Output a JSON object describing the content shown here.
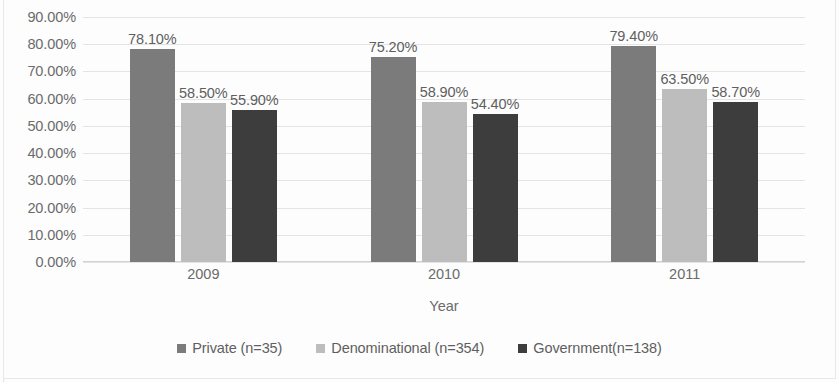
{
  "chart_data": {
    "type": "bar",
    "title": "",
    "xlabel": "Year",
    "ylabel": "",
    "categories": [
      "2009",
      "2010",
      "2011"
    ],
    "series": [
      {
        "name": "Private (n=35)",
        "color": "#7b7b7b",
        "values": [
          78.1,
          58.5,
          79.4
        ],
        "labels": [
          "78.10%",
          "58.50%",
          "79.40%"
        ]
      },
      {
        "name": "Denominational (n=354)",
        "color": "#bdbdbd",
        "values": [
          58.5,
          58.9,
          63.5
        ],
        "labels": [
          "58.50%",
          "58.90%",
          "63.50%"
        ]
      },
      {
        "name": "Government(n=138)",
        "color": "#3d3d3d",
        "values": [
          55.9,
          54.4,
          58.7
        ],
        "labels": [
          "55.90%",
          "54.40%",
          "58.70%"
        ]
      }
    ],
    "grouped_values": [
      [
        78.1,
        58.5,
        55.9
      ],
      [
        75.2,
        58.9,
        54.4
      ],
      [
        79.4,
        63.5,
        58.7
      ]
    ],
    "grouped_labels": [
      [
        "78.10%",
        "58.50%",
        "55.90%"
      ],
      [
        "75.20%",
        "58.90%",
        "54.40%"
      ],
      [
        "79.40%",
        "63.50%",
        "58.70%"
      ]
    ],
    "ylim": [
      0,
      90
    ],
    "ytick_step": 10,
    "ytick_labels": [
      "90.00%",
      "80.00%",
      "70.00%",
      "60.00%",
      "50.00%",
      "40.00%",
      "30.00%",
      "20.00%",
      "10.00%",
      "0.00%"
    ],
    "ytick_values": [
      90,
      80,
      70,
      60,
      50,
      40,
      30,
      20,
      10,
      0
    ],
    "grid": true,
    "legend_position": "bottom"
  },
  "axis": {
    "x_title": "Year"
  },
  "legend": {
    "items": [
      {
        "label": "Private (n=35)",
        "color": "#7b7b7b"
      },
      {
        "label": "Denominational (n=354)",
        "color": "#bdbdbd"
      },
      {
        "label": "Government(n=138)",
        "color": "#3d3d3d"
      }
    ]
  }
}
